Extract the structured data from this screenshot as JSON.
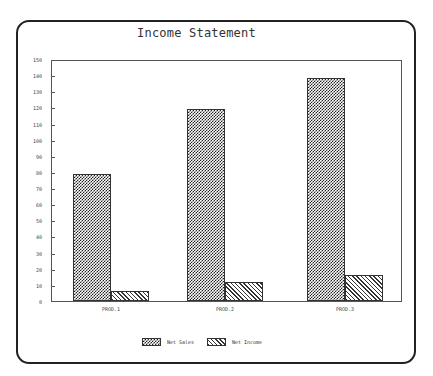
{
  "chart_data": {
    "type": "bar",
    "title": "Income Statement",
    "categories": [
      "PROD.1",
      "PROD.2",
      "PROD.3"
    ],
    "series": [
      {
        "name": "Net Sales",
        "values": [
          79,
          119,
          138
        ],
        "pattern": "crosshatch"
      },
      {
        "name": "Net Income",
        "values": [
          6,
          12,
          16
        ],
        "pattern": "diagonal-hatch"
      }
    ],
    "xlabel": "",
    "ylabel": "",
    "ylim": [
      0,
      150
    ],
    "yticks": [
      0,
      10,
      20,
      30,
      40,
      50,
      60,
      70,
      80,
      90,
      100,
      110,
      120,
      130,
      140,
      150
    ],
    "grid": false,
    "legend_position": "bottom"
  },
  "title": "Income Statement",
  "legend": {
    "net_sales": "Net Sales",
    "net_income": "Net Income"
  },
  "colors": {
    "frame": "#222222",
    "pattern": "#222222",
    "background": "#ffffff"
  }
}
